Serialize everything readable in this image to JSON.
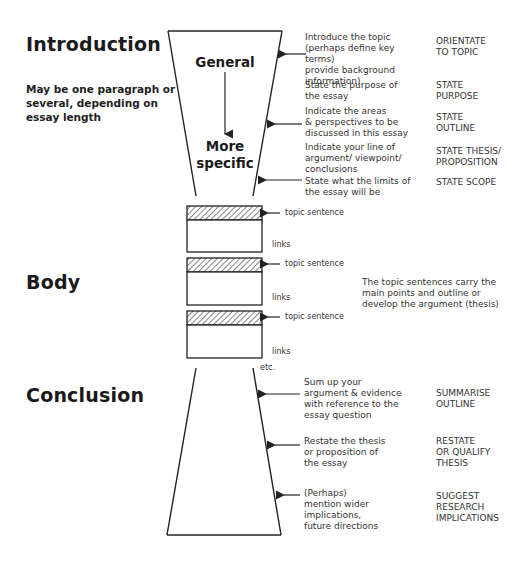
{
  "introduction": {
    "title": "Introduction",
    "note": "May be one paragraph or several, depending on essay length",
    "funnel_top_label": "General",
    "funnel_bottom_label": "More specific",
    "steps": [
      {
        "description": "Introduce the topic\n(perhaps define key terms)\nprovide background\ninformation)",
        "tag": "ORIENTATE\nTO TOPIC"
      },
      {
        "description": "State the purpose of\nthe essay",
        "tag": "STATE\nPURPOSE"
      },
      {
        "description": "Indicate the areas\n& perspectives to be\ndiscussed in this essay",
        "tag": "STATE\nOUTLINE"
      },
      {
        "description": "Indicate your line of\nargument/ viewpoint/\nconclusions",
        "tag": "STATE THESIS/\nPROPOSITION"
      },
      {
        "description": "State what the limits of\nthe essay will be",
        "tag": "STATE SCOPE"
      }
    ]
  },
  "body": {
    "title": "Body",
    "paragraphs": [
      {
        "topic_label": "topic sentence",
        "links_label": "links"
      },
      {
        "topic_label": "topic sentence",
        "links_label": "links"
      },
      {
        "topic_label": "topic sentence",
        "links_label": "links"
      }
    ],
    "etc_label": "etc.",
    "note": "The topic sentences carry the\nmain points and outline or\ndevelop the argument (thesis)"
  },
  "conclusion": {
    "title": "Conclusion",
    "steps": [
      {
        "description": "Sum up your\nargument & evidence\nwith reference to the\nessay question",
        "tag": "SUMMARISE\nOUTLINE"
      },
      {
        "description": "Restate the thesis\nor proposition of\nthe essay",
        "tag": "RESTATE\nor QUALIFY\nTHESIS"
      },
      {
        "description": "(Perhaps)\nmention wider\nimplications,\nfuture directions",
        "tag": "SUGGEST\nRESEARCH\nIMPLICATIONS"
      }
    ]
  },
  "colors": {
    "line": "#222222",
    "text": "#333333",
    "hatch": "#555555"
  }
}
